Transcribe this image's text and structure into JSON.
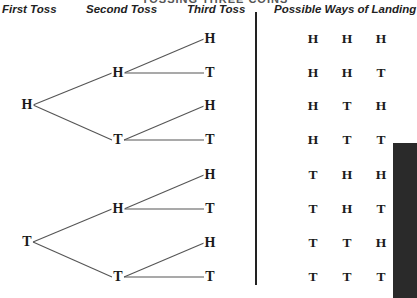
{
  "title": "TOSSING THREE COINS",
  "headers": {
    "first": "First Toss",
    "second": "Second Toss",
    "third": "Third Toss",
    "outcomes": "Possible Ways of Landing"
  },
  "tree": {
    "first": [
      {
        "label": "H",
        "x": 27,
        "y": 105
      },
      {
        "label": "T",
        "x": 27,
        "y": 242
      }
    ],
    "second": [
      {
        "label": "H",
        "x": 118,
        "y": 73
      },
      {
        "label": "T",
        "x": 118,
        "y": 140
      },
      {
        "label": "H",
        "x": 118,
        "y": 209
      },
      {
        "label": "T",
        "x": 118,
        "y": 277
      }
    ],
    "third": [
      {
        "label": "H",
        "x": 210,
        "y": 39
      },
      {
        "label": "T",
        "x": 210,
        "y": 73
      },
      {
        "label": "H",
        "x": 210,
        "y": 106
      },
      {
        "label": "T",
        "x": 210,
        "y": 140
      },
      {
        "label": "H",
        "x": 210,
        "y": 175
      },
      {
        "label": "T",
        "x": 210,
        "y": 209
      },
      {
        "label": "H",
        "x": 210,
        "y": 243
      },
      {
        "label": "T",
        "x": 210,
        "y": 277
      }
    ]
  },
  "outcomes": [
    [
      "H",
      "H",
      "H"
    ],
    [
      "H",
      "H",
      "T"
    ],
    [
      "H",
      "T",
      "H"
    ],
    [
      "H",
      "T",
      "T"
    ],
    [
      "T",
      "H",
      "H"
    ],
    [
      "T",
      "H",
      "T"
    ],
    [
      "T",
      "T",
      "H"
    ],
    [
      "T",
      "T",
      "T"
    ]
  ],
  "colors": {
    "line": "#555555",
    "text": "#1a1a1a",
    "divider": "#222222"
  }
}
